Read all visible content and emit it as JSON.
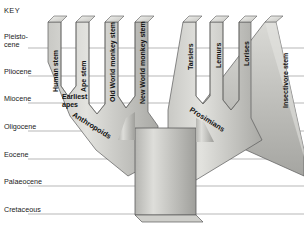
{
  "key": {
    "title": "KEY"
  },
  "epochs": [
    {
      "label": "Pleisto-",
      "label2": "cene",
      "two_line": true,
      "line_y": 48
    },
    {
      "label": "Pliocene",
      "label2": "",
      "two_line": false,
      "line_y": 76
    },
    {
      "label": "Miocene",
      "label2": "",
      "two_line": false,
      "line_y": 103
    },
    {
      "label": "Oligocene",
      "label2": "",
      "two_line": false,
      "line_y": 131
    },
    {
      "label": "Eocene",
      "label2": "",
      "two_line": false,
      "line_y": 159
    },
    {
      "label": "Palaeocene",
      "label2": "",
      "two_line": false,
      "line_y": 186
    },
    {
      "label": "Cretaceous",
      "label2": "",
      "two_line": false,
      "line_y": 214
    }
  ],
  "branches": [
    {
      "id": "human-stem",
      "label": "Human stem"
    },
    {
      "id": "ape-stem",
      "label": "Ape stem"
    },
    {
      "id": "old-world-monkey-stem",
      "label": "Old World monkey stem"
    },
    {
      "id": "new-world-monkey-stem",
      "label": "New World monkey stem"
    },
    {
      "id": "tarsiers",
      "label": "Tarsiers"
    },
    {
      "id": "lemurs",
      "label": "Lemurs"
    },
    {
      "id": "lorises",
      "label": "Lorises"
    },
    {
      "id": "insectivore-stem",
      "label": "Insectivore stem"
    }
  ],
  "nodes": [
    {
      "id": "earliest-apes",
      "label": "Earliest",
      "label2": "apes"
    }
  ],
  "groups": [
    {
      "id": "anthropoids",
      "label": "Anthropoids"
    },
    {
      "id": "prosimians",
      "label": "Prosimians"
    }
  ],
  "colors": {
    "background": "#ffffff",
    "tree_light": "#d8d8d4",
    "tree_mid": "#bcbcb8",
    "tree_dark": "#9b9b97",
    "outline": "#555555",
    "epoch_line": "#9a9a9a",
    "text": "#1a1a1a"
  }
}
